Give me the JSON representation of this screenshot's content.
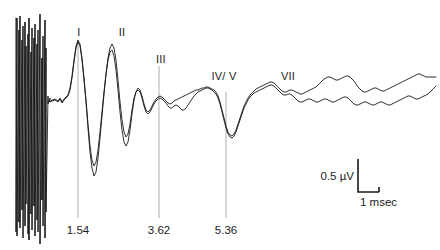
{
  "figure": {
    "name": "auditory-brainstem-response-waveform",
    "background_color": "#ffffff",
    "trace_color": "#1a1a1a",
    "marker_color": "#8c8c8c",
    "width": 440,
    "height": 250
  },
  "peak_labels": [
    {
      "text": "I",
      "x": 79,
      "y": 26
    },
    {
      "text": "II",
      "x": 122,
      "y": 26
    },
    {
      "text": "III",
      "x": 161,
      "y": 53
    },
    {
      "text": "IV/ V",
      "x": 224,
      "y": 70
    },
    {
      "text": "VII",
      "x": 288,
      "y": 70
    }
  ],
  "latency_markers": [
    {
      "text": "1.54",
      "x": 78,
      "y": 224,
      "line_top": 40,
      "line_bottom": 218
    },
    {
      "text": "3.62",
      "x": 159,
      "y": 224,
      "line_top": 66,
      "line_bottom": 218
    },
    {
      "text": "5.36",
      "x": 226,
      "y": 224,
      "line_top": 92,
      "line_bottom": 218
    }
  ],
  "scale_bar": {
    "amplitude_label": "0.5 µV",
    "time_label": "1 msec",
    "corner_x": 358,
    "corner_y": 192,
    "top_y": 159,
    "right_x": 379
  },
  "chart_data": {
    "type": "line",
    "title": "",
    "xlabel": "msec",
    "ylabel": "µV",
    "grid": false,
    "legend": "none",
    "axis_units": {
      "amplitude": "µV",
      "time": "msec"
    },
    "calibration": {
      "amplitude_uV": 0.5,
      "time_msec": 1
    },
    "peaks": [
      {
        "label": "I",
        "latency_msec": 1.54
      },
      {
        "label": "II",
        "latency_msec": null
      },
      {
        "label": "III",
        "latency_msec": 3.62
      },
      {
        "label": "IV/ V",
        "latency_msec": 5.36
      },
      {
        "label": "VII",
        "latency_msec": null
      }
    ],
    "series": [
      {
        "name": "trace-1",
        "points": "16,18 16,232 17,18 17,236 19,30 19,222 20,16 20,228 22,40 22,210 23,26 23,238 25,22 25,226 26,46 26,204 28,34 28,234 29,18 29,240 31,52 31,214 32,28 32,230 34,38 34,206 35,24 35,236 37,44 37,220 38,30 38,232 40,14 40,244 42,58 42,200 43,36 43,226 45,20 45,238 46,48 46,212 48,96 48,104 50,98 50,102 52,100 52,100 55,99 58,101 60,98 62,102 64,99 66,97 68,95 70,88 72,76 74,60 76,46 78,40 80,44 82,58 84,78 86,100 88,124 90,146 92,160 94,166 96,162 98,150 100,132 102,112 104,92 106,74 108,60 110,52 112,50 114,56 116,70 118,90 120,112 122,130 124,142 126,146 128,142 130,130 132,114 134,100 136,92 138,88 140,90 142,96 144,104 146,110 148,112 150,110 152,106 154,102 156,99 158,97 160,96 162,97 164,99 166,101 168,103 170,104 172,103 174,101 176,100 178,99 180,98 182,97 184,96 186,95 188,94 190,93 192,92 194,91 196,90 198,90 200,89 202,88 204,88 206,87 208,87 210,88 212,89 214,90 216,92 218,96 220,102 222,110 224,118 226,126 228,132 230,135 232,136 234,134 236,130 238,124 240,118 242,112 244,106 246,102 248,98 250,95 252,93 254,91 256,89 258,88 260,87 262,86 264,85 266,84 268,83 270,82 272,82 274,83 276,85 278,87 280,89 282,91 284,92 286,92 288,91 290,90 292,90 294,91 296,92 298,93 300,94 302,94 304,93 306,92 308,91 310,90 312,89 314,88 316,87 318,85 320,83 322,81 324,79 326,78 328,77 330,77 332,78 334,79 336,80 338,80 340,79 342,78 344,77 346,76 348,76 350,77 352,79 354,81 356,84 358,87 360,89 362,91 364,92 366,92 368,91 370,90 372,89 374,88 376,88 378,89 380,90 382,91 384,91 386,90 388,89 390,88 392,87 394,86 396,85 398,84 400,83 402,82 404,81 406,80 408,79 410,78 412,77 414,76 416,75 418,74 420,74 422,75 424,76 426,77 428,77 430,77 432,77 434,77 436,77"
      },
      {
        "name": "trace-2",
        "points": "48,100 50,102 52,101 55,100 58,102 60,99 62,103 64,100 66,98 68,96 70,90 72,78 74,62 76,48 78,42 80,46 82,60 84,80 86,102 88,128 90,152 92,168 94,176 96,172 98,158 100,138 102,116 104,94 106,74 108,58 110,48 112,44 114,48 116,60 118,80 120,102 122,120 124,132 126,137 128,134 130,124 132,110 134,98 136,92 138,90 140,92 142,98 144,106 146,112 148,114 150,112 152,108 154,104 156,101 158,99 160,98 162,99 164,101 166,103 168,106 170,108 172,108 174,106 176,105 178,106 180,108 182,110 184,110 186,108 188,105 190,102 192,99 194,96 196,94 198,92 200,91 202,90 204,89 206,88 208,88 210,89 212,90 214,92 216,94 218,98 220,104 222,112 224,120 226,128 228,134 230,137 232,138 234,136 236,132 238,126 240,120 242,114 244,108 246,104 248,100 250,97 252,95 254,93 256,92 258,91 260,90 262,89 264,88 266,87 268,86 270,85 272,85 274,86 276,88 278,90 280,92 282,94 284,95 286,95 288,94 290,94 292,95 294,97 296,99 298,101 300,102 302,102 304,101 306,100 308,99 310,99 312,100 314,101 316,102 318,102 320,101 322,100 324,99 326,99 328,100 330,101 332,102 334,102 336,101 338,100 340,99 342,98 344,97 346,97 348,98 350,100 352,102 354,104 356,105 358,105 360,104 362,103 364,102 366,102 368,103 370,104 372,105 374,105 376,104 378,103 380,102 382,102 384,103 386,104 388,105 390,105 392,104 394,103 396,102 398,101 400,100 402,99 404,98 406,97 408,96 410,96 412,97 414,98 416,99 418,99 420,98 422,97 424,96 426,95 428,94 430,92 432,90 434,88 436,86"
      }
    ]
  }
}
